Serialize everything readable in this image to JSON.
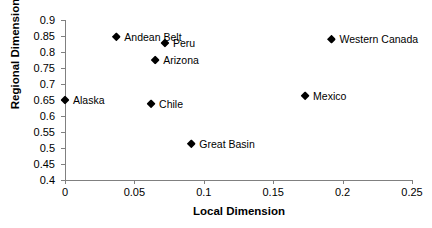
{
  "chart_data": {
    "type": "scatter",
    "title": "",
    "xlabel": "Local Dimension",
    "ylabel": "Regional Dimension",
    "xlim": [
      0,
      0.25
    ],
    "ylim": [
      0.4,
      0.9
    ],
    "xticks": [
      "0",
      "0.05",
      "0.1",
      "0.15",
      "0.2",
      "0.25"
    ],
    "xtick_values": [
      0,
      0.05,
      0.1,
      0.15,
      0.2,
      0.25
    ],
    "yticks": [
      "0.4",
      "0.45",
      "0.5",
      "0.55",
      "0.6",
      "0.65",
      "0.7",
      "0.75",
      "0.8",
      "0.85",
      "0.9"
    ],
    "ytick_values": [
      0.4,
      0.45,
      0.5,
      0.55,
      0.6,
      0.65,
      0.7,
      0.75,
      0.8,
      0.85,
      0.9
    ],
    "grid": false,
    "legend": "none",
    "marker": "diamond",
    "marker_color": "#000000",
    "axis_color": "#808080",
    "points": [
      {
        "label": "Alaska",
        "x": 0.0,
        "y": 0.65,
        "label_side": "right"
      },
      {
        "label": "Andean Belt",
        "x": 0.037,
        "y": 0.848,
        "label_side": "right"
      },
      {
        "label": "Chile",
        "x": 0.062,
        "y": 0.638,
        "label_side": "right"
      },
      {
        "label": "Arizona",
        "x": 0.065,
        "y": 0.775,
        "label_side": "right"
      },
      {
        "label": "Peru",
        "x": 0.072,
        "y": 0.828,
        "label_side": "right"
      },
      {
        "label": "Great Basin",
        "x": 0.091,
        "y": 0.513,
        "label_side": "right"
      },
      {
        "label": "Mexico",
        "x": 0.173,
        "y": 0.663,
        "label_side": "right"
      },
      {
        "label": "Western Canada",
        "x": 0.192,
        "y": 0.84,
        "label_side": "right"
      }
    ]
  }
}
